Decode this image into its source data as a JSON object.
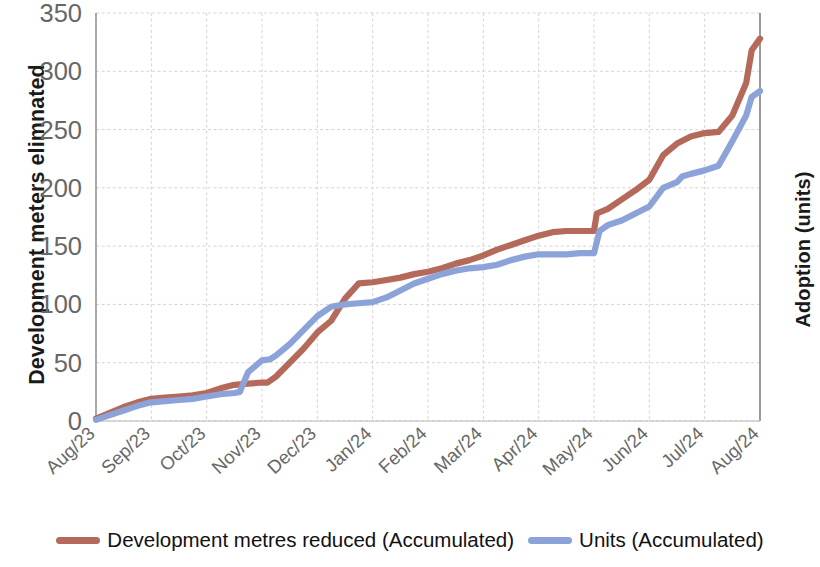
{
  "chart_data": {
    "type": "line",
    "title": "",
    "xlabel": "",
    "ylabel": "Development meters elimnated",
    "ylabel_right": "Adoption  (units)",
    "categories": [
      "Aug/23",
      "Sep/23",
      "Oct/23",
      "Nov/23",
      "Dec/23",
      "Jan/24",
      "Feb/24",
      "Mar/24",
      "Apr/24",
      "May/24",
      "Jun/24",
      "Jul/24",
      "Aug/24"
    ],
    "ylim": [
      0,
      350
    ],
    "yticks": [
      0,
      50,
      100,
      150,
      200,
      250,
      300,
      350
    ],
    "ytick_labels": [
      "0",
      "50",
      "100",
      "150",
      "200",
      "250",
      "300",
      "350"
    ],
    "grid": true,
    "legend_position": "bottom",
    "series": [
      {
        "name": "Development metres reduced (Accumulated)",
        "color": "#b5695a",
        "axis": "left",
        "x": [
          0,
          0.25,
          0.5,
          0.75,
          1,
          1.25,
          1.5,
          1.75,
          2,
          2.25,
          2.5,
          2.75,
          3,
          3.1,
          3.25,
          3.5,
          3.75,
          4,
          4.25,
          4.5,
          4.75,
          5,
          5.25,
          5.5,
          5.75,
          6,
          6.25,
          6.5,
          6.75,
          7,
          7.25,
          7.5,
          7.75,
          8,
          8.25,
          8.5,
          8.75,
          9,
          9.05,
          9.25,
          9.5,
          9.75,
          10,
          10.25,
          10.5,
          10.75,
          11,
          11.25,
          11.5,
          11.75,
          11.85,
          12
        ],
        "values": [
          2,
          7,
          12,
          16,
          19,
          20,
          21,
          22,
          24,
          28,
          31,
          32,
          33,
          33,
          38,
          50,
          62,
          76,
          86,
          105,
          118,
          119,
          121,
          123,
          126,
          128,
          131,
          135,
          138,
          142,
          147,
          151,
          155,
          159,
          162,
          163,
          163,
          163,
          178,
          182,
          190,
          198,
          207,
          228,
          238,
          244,
          247,
          248,
          262,
          290,
          318,
          328
        ]
      },
      {
        "name": "Units (Accumulated)",
        "color": "#8ba3d8",
        "axis": "right",
        "x": [
          0,
          0.25,
          0.5,
          0.75,
          1,
          1.25,
          1.5,
          1.75,
          2,
          2.25,
          2.5,
          2.6,
          2.75,
          3,
          3.15,
          3.25,
          3.5,
          3.75,
          4,
          4.25,
          4.5,
          4.75,
          5,
          5.25,
          5.5,
          5.75,
          6,
          6.25,
          6.5,
          6.75,
          7,
          7.25,
          7.5,
          7.75,
          8,
          8.25,
          8.5,
          8.75,
          9,
          9.1,
          9.25,
          9.5,
          9.75,
          10,
          10.25,
          10.5,
          10.6,
          10.75,
          11,
          11.25,
          11.5,
          11.75,
          11.85,
          12
        ],
        "values": [
          1,
          5,
          9,
          13,
          16,
          17,
          18,
          19,
          21,
          23,
          24,
          25,
          42,
          52,
          53,
          56,
          66,
          78,
          90,
          98,
          100,
          101,
          102,
          106,
          112,
          118,
          122,
          126,
          129,
          131,
          132,
          134,
          138,
          141,
          143,
          143,
          143,
          144,
          144,
          163,
          168,
          172,
          178,
          184,
          200,
          205,
          210,
          212,
          215,
          219,
          240,
          262,
          278,
          283
        ]
      }
    ]
  },
  "legend": {
    "items": [
      {
        "label": "Development metres reduced (Accumulated)",
        "color": "#b5695a"
      },
      {
        "label": "Units (Accumulated)",
        "color": "#8ba3d8"
      }
    ]
  }
}
